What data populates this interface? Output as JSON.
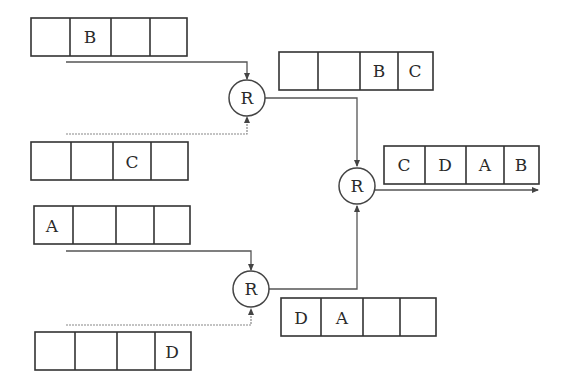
{
  "diagram": {
    "title": "",
    "node_label": "R",
    "inputs": {
      "in1": {
        "cells": [
          "",
          "B",
          "",
          ""
        ]
      },
      "in2": {
        "cells": [
          "",
          "",
          "C",
          ""
        ]
      },
      "in3": {
        "cells": [
          "A",
          "",
          "",
          ""
        ]
      },
      "in4": {
        "cells": [
          "",
          "",
          "",
          "D"
        ]
      }
    },
    "intermediate": {
      "top": {
        "cells": [
          "",
          "",
          "B",
          "C"
        ]
      },
      "bottom": {
        "cells": [
          "D",
          "A",
          "",
          ""
        ]
      }
    },
    "output": {
      "cells": [
        "C",
        "D",
        "A",
        "B"
      ]
    },
    "nodes": [
      {
        "id": "r1",
        "label": "R"
      },
      {
        "id": "r2",
        "label": "R"
      },
      {
        "id": "r3",
        "label": "R"
      }
    ]
  }
}
